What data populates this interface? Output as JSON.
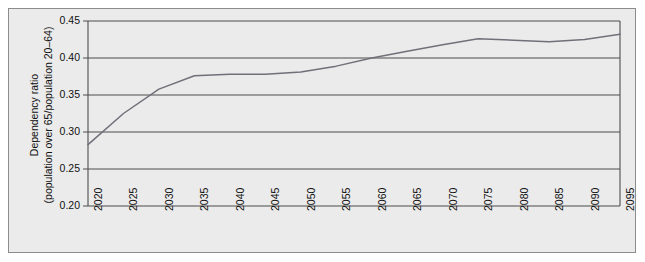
{
  "chart_data": {
    "type": "line",
    "title": "",
    "xlabel": "",
    "ylabel_line1": "Dependency ratio",
    "ylabel_line2": "(population over 65/population 20–64)",
    "x": [
      2020,
      2025,
      2030,
      2035,
      2040,
      2045,
      2050,
      2055,
      2060,
      2065,
      2070,
      2075,
      2080,
      2085,
      2090,
      2095
    ],
    "xtick_labels": [
      "2020",
      "2025",
      "2030",
      "2035",
      "2040",
      "2045",
      "2050",
      "2055",
      "2060",
      "2065",
      "2070",
      "2075",
      "2080",
      "2085",
      "2090",
      "2095"
    ],
    "values": [
      0.283,
      0.325,
      0.358,
      0.376,
      0.378,
      0.378,
      0.381,
      0.389,
      0.4,
      0.409,
      0.418,
      0.426,
      0.424,
      0.422,
      0.425,
      0.432
    ],
    "ytick_labels": [
      "0.20",
      "0.25",
      "0.30",
      "0.35",
      "0.40",
      "0.45"
    ],
    "ytick_values": [
      0.2,
      0.25,
      0.3,
      0.35,
      0.4,
      0.45
    ],
    "ylim": [
      0.2,
      0.45
    ],
    "xlim": [
      2020,
      2095
    ],
    "grid": "horizontal",
    "legend": "none",
    "series_color": "#70707a",
    "plot_background": "#ebebeb",
    "axis_color": "#4d4d4d",
    "frame_color": "#8c8c8c"
  }
}
